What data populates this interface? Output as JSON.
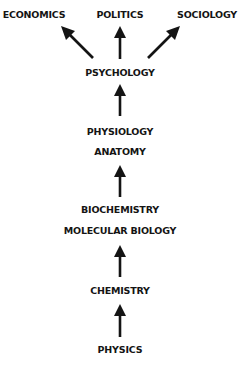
{
  "diagram": {
    "nodes": {
      "economics": "ECONOMICS",
      "politics": "POLITICS",
      "sociology": "SOCIOLOGY",
      "psychology": "PSYCHOLOGY",
      "physiology": "PHYSIOLOGY",
      "anatomy": "ANATOMY",
      "biochemistry": "BIOCHEMISTRY",
      "molecular_biology": "MOLECULAR BIOLOGY",
      "chemistry": "CHEMISTRY",
      "physics": "PHYSICS"
    },
    "edges": [
      {
        "from": "physics",
        "to": "chemistry"
      },
      {
        "from": "chemistry",
        "to": "biochemistry_molecular_biology"
      },
      {
        "from": "biochemistry_molecular_biology",
        "to": "physiology_anatomy"
      },
      {
        "from": "physiology_anatomy",
        "to": "psychology"
      },
      {
        "from": "psychology",
        "to": "economics"
      },
      {
        "from": "psychology",
        "to": "politics"
      },
      {
        "from": "psychology",
        "to": "sociology"
      }
    ],
    "colors": {
      "ink": "#141414",
      "background": "#ffffff"
    }
  }
}
